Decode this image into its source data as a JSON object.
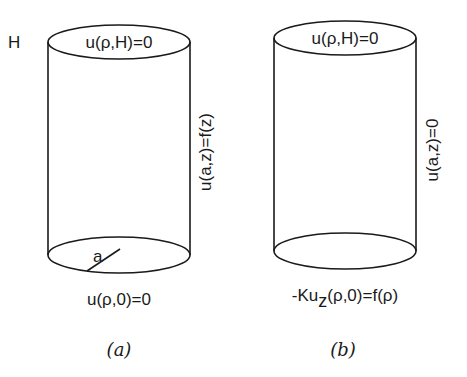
{
  "figure_a": {
    "height_label": "H",
    "top_condition": "u(ρ,H)=0",
    "side_condition": "u(a,z)=f(z)",
    "radius_label": "a",
    "bottom_condition": "u(ρ,0)=0",
    "caption": "(a)"
  },
  "figure_b": {
    "top_condition": "u(ρ,H)=0",
    "side_condition": "u(a,z)=0",
    "bottom_condition_prefix": "-Ku",
    "bottom_condition_subscript": "z",
    "bottom_condition_suffix": "(ρ,0)=f(ρ)",
    "caption": "(b)"
  }
}
